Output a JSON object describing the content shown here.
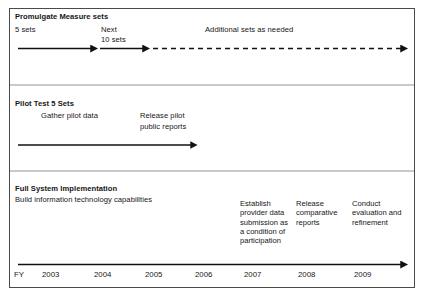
{
  "figure": {
    "background_color": "#ffffff",
    "border_color": "#4a4a4a",
    "line_color": "#111111"
  },
  "bands": [
    {
      "id": "promulgate",
      "heading": "Promulgate Measure sets",
      "labels": [
        {
          "name": "five-sets",
          "text": "5 sets"
        },
        {
          "name": "next",
          "text": "Next"
        },
        {
          "name": "ten-sets",
          "text": "10 sets"
        },
        {
          "name": "additional-sets",
          "text": "Additional sets as needed"
        }
      ]
    },
    {
      "id": "pilot",
      "heading": "Pilot Test 5 Sets",
      "labels": [
        {
          "name": "gather-pilot-data",
          "text": "Gather pilot data"
        },
        {
          "name": "release-pilot-line1",
          "text": "Release pilot"
        },
        {
          "name": "release-pilot-line2",
          "text": "public reports"
        }
      ]
    },
    {
      "id": "full-system",
      "heading": "Full System Implementation",
      "subheading": "Build information technology capabilities",
      "columns": [
        {
          "name": "establish-provider-data",
          "text": "Establish provider data submission as a condition of participation"
        },
        {
          "name": "release-comparative-reports",
          "text": "Release comparative reports"
        },
        {
          "name": "conduct-evaluation",
          "text": "Conduct evaluation and refinement"
        }
      ]
    }
  ],
  "axis": {
    "prefix": "FY",
    "years": [
      "2003",
      "2004",
      "2005",
      "2006",
      "2007",
      "2008",
      "2009"
    ]
  }
}
